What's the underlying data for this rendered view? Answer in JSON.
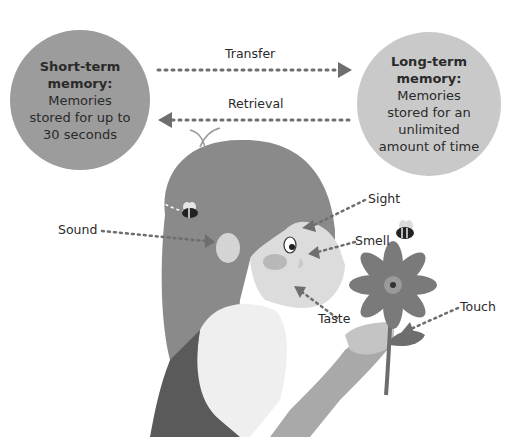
{
  "short_term": {
    "title_line1": "Short-term",
    "title_line2": "memory:",
    "desc_line1": "Memories",
    "desc_line2": "stored for up to",
    "desc_line3": "30 seconds"
  },
  "long_term": {
    "title_line1": "Long-term",
    "title_line2": "memory:",
    "desc_line1": "Memories",
    "desc_line2": "stored for an",
    "desc_line3": "unlimited",
    "desc_line4": "amount of time"
  },
  "arrows": {
    "transfer": "Transfer",
    "retrieval": "Retrieval"
  },
  "senses": {
    "sound": "Sound",
    "sight": "Sight",
    "smell": "Smell",
    "taste": "Taste",
    "touch": "Touch"
  },
  "colors": {
    "short_circle": "#9c9c9c",
    "long_circle": "#c9c9c9",
    "arrow": "#6e6e6e",
    "hair": "#8a8a8a",
    "skin": "#dcdcdc",
    "flower": "#7a7a7a"
  }
}
